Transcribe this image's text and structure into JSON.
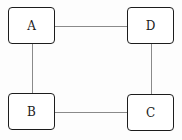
{
  "diagram": {
    "type": "graph",
    "nodes": [
      {
        "id": "A",
        "label": "A",
        "x": 8,
        "y": 7,
        "w": 47,
        "h": 37
      },
      {
        "id": "D",
        "label": "D",
        "x": 127,
        "y": 7,
        "w": 47,
        "h": 37
      },
      {
        "id": "B",
        "label": "B",
        "x": 8,
        "y": 93,
        "w": 47,
        "h": 37
      },
      {
        "id": "C",
        "label": "C",
        "x": 127,
        "y": 94,
        "w": 47,
        "h": 37
      }
    ],
    "edges": [
      {
        "from": "A",
        "to": "D"
      },
      {
        "from": "A",
        "to": "B"
      },
      {
        "from": "D",
        "to": "C"
      },
      {
        "from": "B",
        "to": "C"
      }
    ],
    "colors": {
      "node_border": "#1c1c1c",
      "edge": "#8a8a8a",
      "background": "#ffffff"
    }
  }
}
